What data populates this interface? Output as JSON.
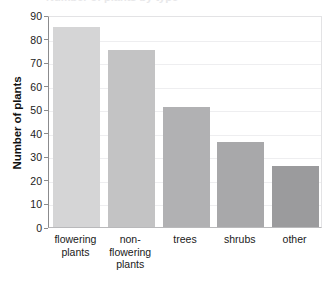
{
  "chart_data": {
    "type": "bar",
    "title": "Number of plants by type",
    "title_visible": false,
    "xlabel": "",
    "ylabel": "Number of plants",
    "categories": [
      "flowering plants",
      "non-flowering plants",
      "trees",
      "shrubs",
      "other"
    ],
    "category_lines": [
      [
        "flowering",
        "plants"
      ],
      [
        "non-",
        "flowering",
        "plants"
      ],
      [
        "trees"
      ],
      [
        "shrubs"
      ],
      [
        "other"
      ]
    ],
    "values": [
      85,
      75,
      51,
      36,
      26
    ],
    "bar_colors": [
      "#d5d5d6",
      "#c3c3c4",
      "#b1b1b3",
      "#a8a8aa",
      "#9b9b9d"
    ],
    "ylim": [
      0,
      90
    ],
    "ytick_values": [
      90,
      80,
      70,
      60,
      50,
      40,
      30,
      20,
      10,
      0
    ],
    "ytick_labels": [
      "90",
      "80",
      "70",
      "60",
      "50",
      "40",
      "30",
      "20",
      "10",
      "0"
    ],
    "grid": true,
    "grid_axis": "y",
    "legend": false,
    "legend_position": "none"
  },
  "style": {
    "grid_color": "#eeeef0",
    "axis_color": "#8b8b8d",
    "frame_color": "#e3e3e5",
    "text_color": "#1a1a1a",
    "background": "#ffffff"
  }
}
